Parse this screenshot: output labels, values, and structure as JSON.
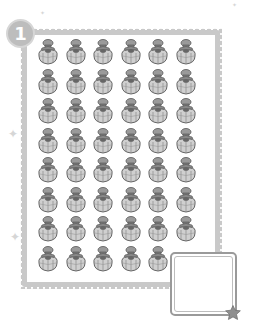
{
  "exercise": {
    "number": "1",
    "grid": {
      "columns": 6,
      "rows": 8,
      "item_count": 47,
      "item_type": "perfume-bottle"
    },
    "answer_box": {
      "value": ""
    }
  },
  "colors": {
    "frame": "#c9c9c9",
    "badge": "#bdbdbd",
    "answer_border": "#9a9a9a",
    "star": "#8f8f8f"
  }
}
